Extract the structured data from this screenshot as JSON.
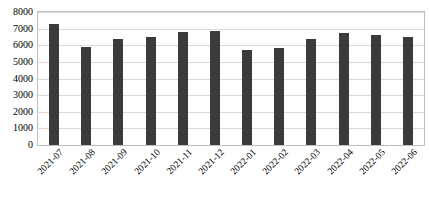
{
  "chart_data": {
    "type": "bar",
    "title": "",
    "subtitle": "",
    "xlabel": "",
    "ylabel": "",
    "categories": [
      "2021-07",
      "2021-08",
      "2021-09",
      "2021-10",
      "2021-11",
      "2021-12",
      "2022-01",
      "2022-02",
      "2022-03",
      "2022-04",
      "2022-05",
      "2022-06"
    ],
    "values": [
      7250,
      5900,
      6400,
      6500,
      6800,
      6850,
      5700,
      5850,
      6400,
      6750,
      6600,
      6500
    ],
    "ylim": [
      0,
      8000
    ],
    "ytick_values": [
      0,
      1000,
      2000,
      3000,
      4000,
      5000,
      6000,
      7000,
      8000
    ],
    "ytick_labels": [
      "0",
      "1000",
      "2000",
      "3000",
      "4000",
      "5000",
      "6000",
      "7000",
      "8000"
    ],
    "grid": true,
    "grid_axis": "y",
    "legend": false,
    "legend_position": "none",
    "bar_color": "#3b3b3b",
    "gridline_color": "#d9d9d9",
    "plot_border_color": "#bfbfbf",
    "background_color": "#ffffff",
    "xtick_rotation": -45,
    "annotations": []
  }
}
